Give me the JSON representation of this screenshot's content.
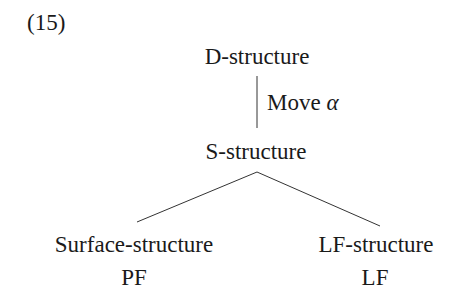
{
  "example_number": "(15)",
  "diagram": {
    "root": "D-structure",
    "transformation": {
      "label": "Move",
      "symbol": "α"
    },
    "middle": "S-structure",
    "branches": [
      {
        "node": "Surface-structure",
        "interface": "PF"
      },
      {
        "node": "LF-structure",
        "interface": "LF"
      }
    ]
  }
}
